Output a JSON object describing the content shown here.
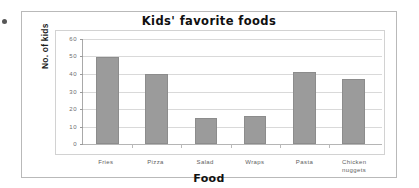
{
  "chart_data": {
    "type": "bar",
    "title": "Kids' favorite foods",
    "xlabel": "Food",
    "ylabel": "No. of kids",
    "categories": [
      "Fries",
      "Pizza",
      "Salad",
      "Wraps",
      "Pasta",
      "Chicken nuggets"
    ],
    "values": [
      50,
      40,
      15,
      16,
      41,
      37
    ],
    "ylim": [
      0,
      60
    ],
    "yticks": [
      0,
      10,
      20,
      30,
      40,
      50,
      60
    ],
    "ytick_labels": [
      "0",
      "10",
      "20",
      "30",
      "40",
      "50",
      "60"
    ],
    "grid": true,
    "legend": false,
    "series": [
      {
        "name": "No. of kids",
        "values": [
          50,
          40,
          15,
          16,
          41,
          37
        ],
        "color": "#9b9b9b"
      }
    ]
  },
  "colors": {
    "bar": "#9b9b9b",
    "bar_border": "#8c8c8c",
    "gridline": "#d9d9d9",
    "axis": "#a9a9a9",
    "frame": "#b9b9b9",
    "text": "#111111",
    "tick_text": "#5e5e5e",
    "background": "#ffffff"
  }
}
